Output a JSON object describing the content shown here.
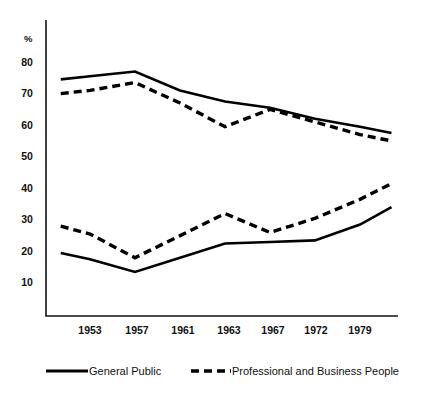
{
  "chart_data": {
    "type": "line",
    "title": "",
    "xlabel": "",
    "ylabel": "%",
    "ylim": [
      0,
      85
    ],
    "yticks": [
      10,
      20,
      30,
      40,
      50,
      60,
      70,
      80
    ],
    "ytick_labels": [
      "10",
      "20",
      "30",
      "40",
      "50",
      "60",
      "70",
      "80"
    ],
    "grid": false,
    "legend_position": "bottom",
    "categories": [
      "1953",
      "1957",
      "1961",
      "1963",
      "1967",
      "1972",
      "1979"
    ],
    "x_positions": [
      1,
      2,
      3,
      4,
      5,
      6,
      7
    ],
    "x_range": [
      0.35,
      7.7
    ],
    "note": "each series is drawn with 8 vertices: a leading point before 1953 and a trailing point after 1979",
    "series": [
      {
        "name": "General Public (upper)",
        "group": "upper",
        "style": "solid",
        "x": [
          0.35,
          1,
          2,
          3,
          4,
          5,
          6,
          7,
          7.7
        ],
        "values": [
          74.5,
          75.5,
          77.0,
          71.0,
          67.5,
          65.5,
          62.0,
          59.5,
          57.5
        ]
      },
      {
        "name": "Professional and Business People (upper)",
        "group": "upper",
        "style": "dashed",
        "x": [
          0.35,
          1,
          2,
          3,
          4,
          5,
          6,
          7,
          7.7
        ],
        "values": [
          70.0,
          71.0,
          73.5,
          67.0,
          59.5,
          65.0,
          61.0,
          57.0,
          55.0
        ]
      },
      {
        "name": "General Public (lower)",
        "group": "lower",
        "style": "solid",
        "x": [
          0.35,
          1,
          2,
          3,
          4,
          5,
          6,
          7,
          7.7
        ],
        "values": [
          19.5,
          17.5,
          13.5,
          18.0,
          22.5,
          23.0,
          23.5,
          28.5,
          34.0
        ]
      },
      {
        "name": "Professional and Business People (lower)",
        "group": "lower",
        "style": "dashed",
        "x": [
          0.35,
          1,
          2,
          3,
          4,
          5,
          6,
          7,
          7.7
        ],
        "values": [
          28.0,
          25.5,
          18.0,
          25.0,
          32.0,
          26.0,
          30.5,
          36.5,
          41.5
        ]
      }
    ],
    "legend": [
      {
        "label": "General Public",
        "style": "solid"
      },
      {
        "label": "Professional and Business People",
        "style": "dashed"
      }
    ]
  },
  "axis": {
    "unit_label": "%",
    "ytick_labels": [
      "80",
      "70",
      "60",
      "50",
      "40",
      "30",
      "20",
      "10"
    ],
    "xtick_labels": [
      "1953",
      "1957",
      "1961",
      "1963",
      "1967",
      "1972",
      "1979"
    ]
  },
  "legend": {
    "series_one_label": "General Public",
    "series_two_label": "Professional and Business People"
  },
  "colors": {
    "line": "#000000",
    "axis": "#111111",
    "background": "#ffffff"
  }
}
